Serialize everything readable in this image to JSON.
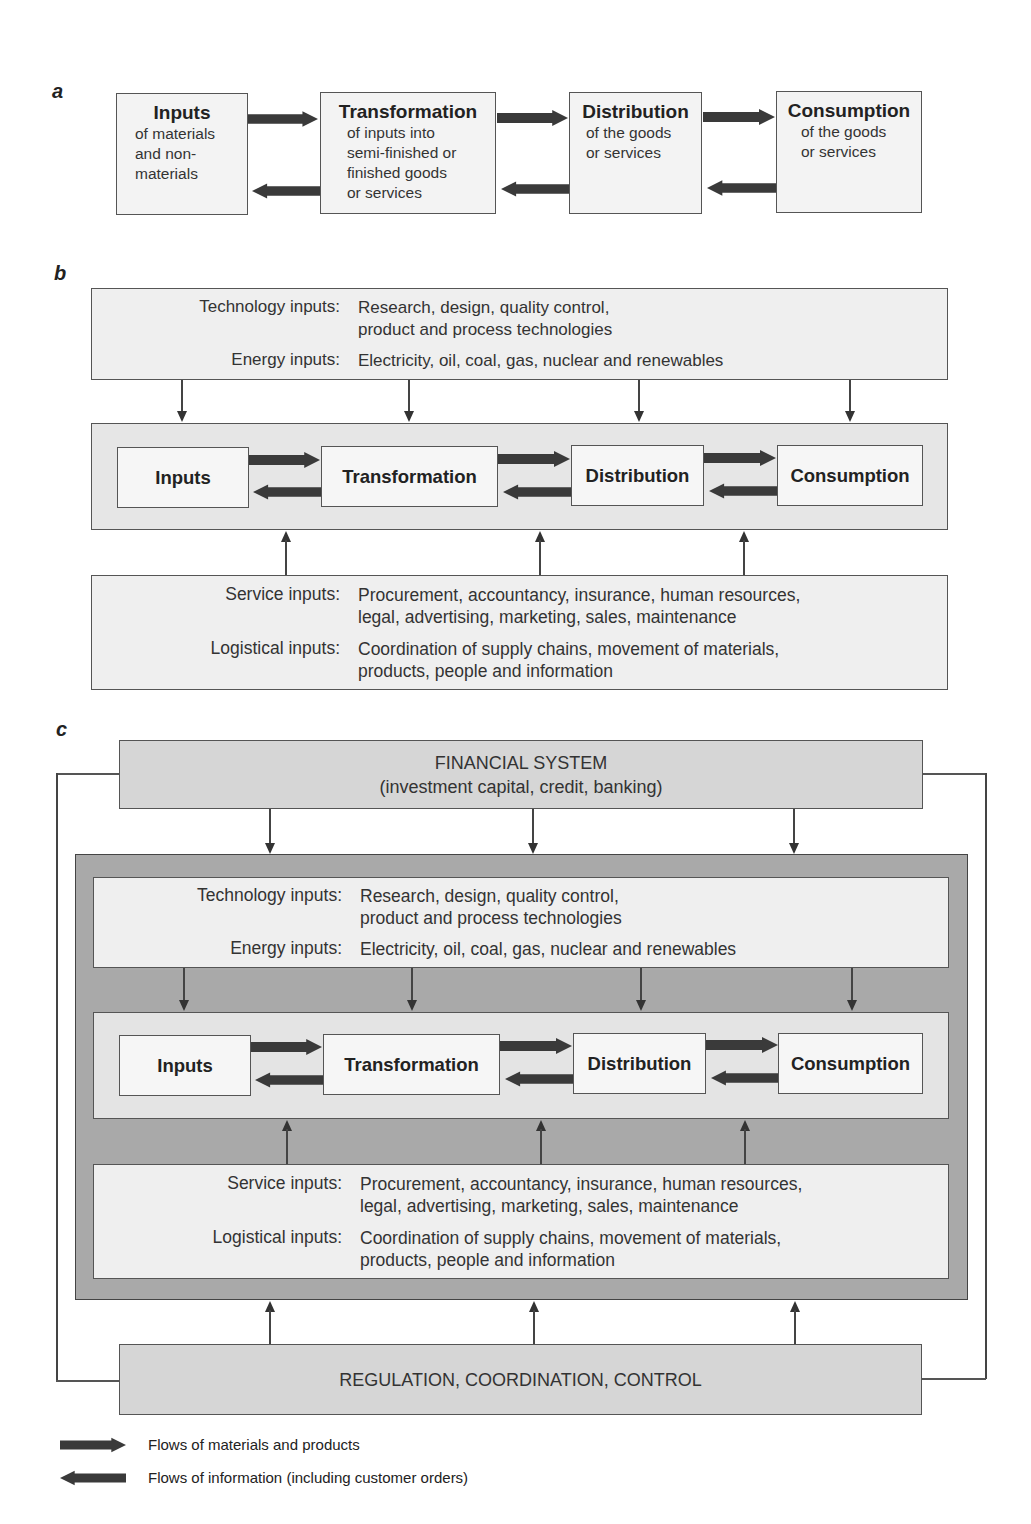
{
  "panels": {
    "a": {
      "label": "a",
      "stages": [
        {
          "title": "Inputs",
          "subtitle_lines": [
            "of materials",
            "and non-",
            "materials"
          ]
        },
        {
          "title": "Transformation",
          "subtitle_lines": [
            "of inputs into",
            "semi-finished or",
            "finished goods",
            "or services"
          ]
        },
        {
          "title": "Distribution",
          "subtitle_lines": [
            "of the goods",
            "or services"
          ]
        },
        {
          "title": "Consumption",
          "subtitle_lines": [
            "of the goods",
            "or services"
          ]
        }
      ]
    },
    "b": {
      "label": "b",
      "top_inputs": [
        {
          "label": "Technology inputs:",
          "lines": [
            "Research, design, quality control,",
            "product and process technologies"
          ]
        },
        {
          "label": "Energy inputs:",
          "lines": [
            "Electricity, oil, coal, gas, nuclear and renewables"
          ]
        }
      ],
      "stages": [
        "Inputs",
        "Transformation",
        "Distribution",
        "Consumption"
      ],
      "bottom_inputs": [
        {
          "label": "Service inputs:",
          "lines": [
            "Procurement, accountancy, insurance, human resources,",
            "legal, advertising, marketing, sales, maintenance"
          ]
        },
        {
          "label": "Logistical inputs:",
          "lines": [
            "Coordination of supply chains, movement of materials,",
            "products, people and information"
          ]
        }
      ]
    },
    "c": {
      "label": "c",
      "financial_system": {
        "title": "FINANCIAL SYSTEM",
        "subtitle": "(investment capital, credit, banking)"
      },
      "top_inputs": [
        {
          "label": "Technology inputs:",
          "lines": [
            "Research, design, quality control,",
            "product and process technologies"
          ]
        },
        {
          "label": "Energy inputs:",
          "lines": [
            "Electricity, oil, coal, gas, nuclear and renewables"
          ]
        }
      ],
      "stages": [
        "Inputs",
        "Transformation",
        "Distribution",
        "Consumption"
      ],
      "bottom_inputs": [
        {
          "label": "Service inputs:",
          "lines": [
            "Procurement, accountancy, insurance, human resources,",
            "legal, advertising, marketing, sales, maintenance"
          ]
        },
        {
          "label": "Logistical inputs:",
          "lines": [
            "Coordination of supply chains, movement of materials,",
            "products, people and information"
          ]
        }
      ],
      "regulation": {
        "title": "REGULATION, COORDINATION, CONTROL"
      }
    }
  },
  "legend": [
    {
      "icon": "arrow-right-icon",
      "label": "Flows of materials and products"
    },
    {
      "icon": "arrow-left-icon",
      "label": "Flows of information (including customer orders)"
    }
  ],
  "colors": {
    "arrow": "#3a3a3a",
    "box_border": "#555555",
    "light_fill": "#efefef",
    "mid_fill": "#d6d6d6",
    "dark_fill": "#a9a9a9"
  }
}
